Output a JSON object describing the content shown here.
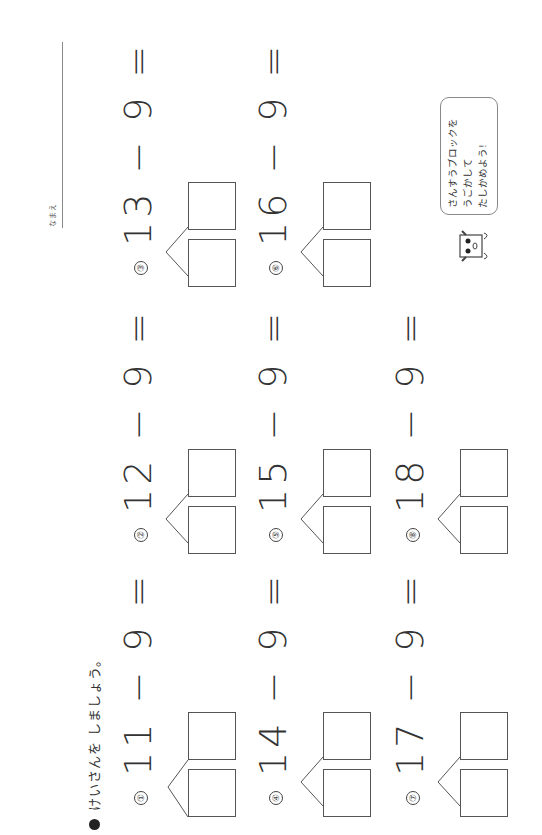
{
  "header": {
    "instruction": "けいさんを しましょう。"
  },
  "name_field": {
    "label": "なまえ"
  },
  "problems": [
    {
      "num": "①",
      "expr": "11 − 9 =",
      "a": "11",
      "b": "9"
    },
    {
      "num": "②",
      "expr": "12 − 9 =",
      "a": "12",
      "b": "9"
    },
    {
      "num": "③",
      "expr": "13 − 9 =",
      "a": "13",
      "b": "9"
    },
    {
      "num": "④",
      "expr": "14 − 9 =",
      "a": "14",
      "b": "9"
    },
    {
      "num": "⑤",
      "expr": "15 − 9 =",
      "a": "15",
      "b": "9"
    },
    {
      "num": "⑥",
      "expr": "16 − 9 =",
      "a": "16",
      "b": "9"
    },
    {
      "num": "⑦",
      "expr": "17 − 9 =",
      "a": "17",
      "b": "9"
    },
    {
      "num": "⑧",
      "expr": "18 − 9 =",
      "a": "18",
      "b": "9"
    }
  ],
  "hint": {
    "line1": "さんすうブロックを",
    "line2": "うごかして",
    "line3": "たしかめよう!"
  },
  "colors": {
    "ink": "#333333",
    "box_border": "#555555"
  }
}
